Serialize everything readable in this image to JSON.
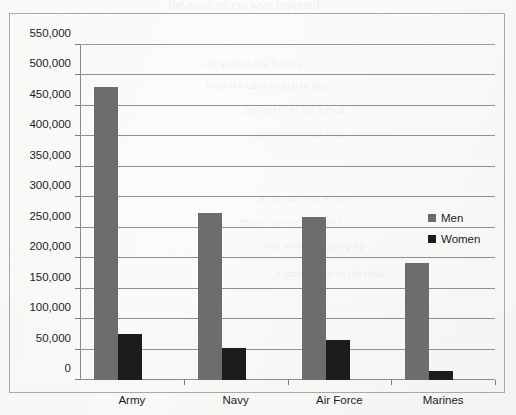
{
  "chart_data": {
    "type": "bar",
    "title": "",
    "subtitle": "",
    "xlabel": "",
    "ylabel": "",
    "categories": [
      "Army",
      "Navy",
      "Air Force",
      "Marines"
    ],
    "series": [
      {
        "name": "Men",
        "color": "#6d6d6d",
        "values": [
          481000,
          275000,
          268000,
          192000
        ]
      },
      {
        "name": "Women",
        "color": "#1c1c1c",
        "values": [
          75000,
          52000,
          65000,
          15000
        ]
      }
    ],
    "ylim": [
      0,
      550000
    ],
    "ytick_step": 50000,
    "ytick_labels": [
      "0",
      "50,000",
      "100,000",
      "150,000",
      "200,000",
      "250,000",
      "300,000",
      "350,000",
      "400,000",
      "450,000",
      "500,000",
      "550,000"
    ],
    "grid": true,
    "grid_axis": "y",
    "legend_position": "right",
    "legend_entries": [
      "Men",
      "Women"
    ],
    "orientation": "vertical",
    "grouping": "grouped",
    "background": "#fbfbfa",
    "frame_border_color": "#a9a9a6",
    "gridline_color": "#8f8f8c",
    "axis_color": "#8a8a87",
    "text_color": "#1c1c1c"
  },
  "scan_artifacts": {
    "bleed_top": "the most recent year reported",
    "bleed_lines": [
      "to be seen in the figures",
      "from the table of active duty",
      "personnel of the armed",
      "services for that year",
      "across all four of the",
      "major service branches",
      "with women making up",
      "a small share of the total"
    ]
  }
}
